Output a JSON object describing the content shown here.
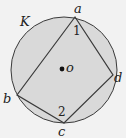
{
  "diagram": {
    "type": "geometry",
    "colors": {
      "circle_fill": "#d9d9d9",
      "stroke": "#3a3a3a",
      "background": "#f2f2f2"
    },
    "circle": {
      "label": "K",
      "center_label": "o",
      "cx": 64,
      "cy": 70,
      "r": 53
    },
    "points": [
      {
        "name": "a",
        "x": 75,
        "y": 17
      },
      {
        "name": "b",
        "x": 17,
        "y": 95
      },
      {
        "name": "c",
        "x": 64,
        "y": 123
      },
      {
        "name": "d",
        "x": 113,
        "y": 75
      }
    ],
    "segments": [
      [
        "a",
        "b"
      ],
      [
        "b",
        "c"
      ],
      [
        "c",
        "d"
      ],
      [
        "d",
        "a"
      ]
    ],
    "angles": [
      {
        "label": "1",
        "vertex": "a"
      },
      {
        "label": "2",
        "vertex": "c"
      }
    ],
    "labels": {
      "circle": "K",
      "center": "o",
      "a": "a",
      "b": "b",
      "c": "c",
      "d": "d",
      "angle1": "1",
      "angle2": "2"
    }
  }
}
